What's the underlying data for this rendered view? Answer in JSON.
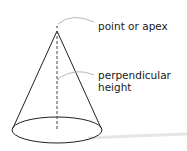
{
  "diagram": {
    "labels": {
      "apex": "point or apex",
      "height_line1": "perpendicular",
      "height_line2": "height"
    },
    "colors": {
      "outline": "#222222",
      "dashed_height": "#444444",
      "leader_line": "#b8b8b8",
      "text": "#1a1a1a",
      "background": "#ffffff"
    }
  }
}
